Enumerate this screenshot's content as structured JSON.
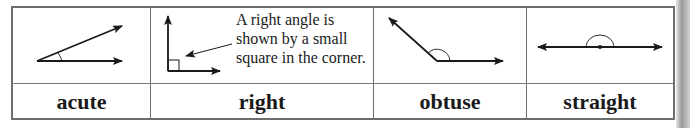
{
  "table": {
    "columns": [
      {
        "id": "acute",
        "label": "acute"
      },
      {
        "id": "right",
        "label": "right",
        "caption": [
          "A right angle is",
          "shown by a small",
          "square in the corner."
        ]
      },
      {
        "id": "obtuse",
        "label": "obtuse"
      },
      {
        "id": "straight",
        "label": "straight"
      }
    ]
  },
  "colors": {
    "border": "#6e6e6e",
    "ink": "#1a1a1a"
  }
}
